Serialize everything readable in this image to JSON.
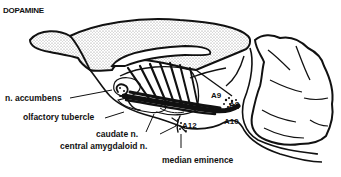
{
  "title": "DOPAMINE",
  "labels": {
    "n_accumbens": "n. accumbens",
    "olfactory_tubercle": "olfactory tubercle",
    "caudate_n": "caudate n.",
    "central_amygdaloid_n": "central amygdaloid n.",
    "median_eminence": "median eminence",
    "a9": "A9",
    "a8": "A8",
    "a10": "A10",
    "a12": "A12"
  },
  "colors": {
    "ink": "#111111",
    "stipple": "#9a9a9a",
    "background": "#ffffff"
  }
}
